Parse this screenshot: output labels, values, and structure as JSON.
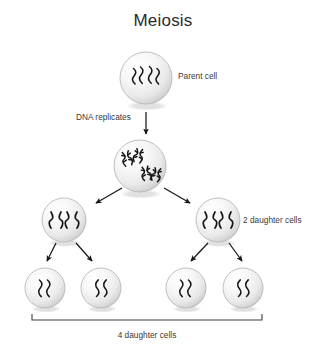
{
  "canvas": {
    "width": 327,
    "height": 349,
    "background": "#ffffff"
  },
  "title": "Meiosis",
  "labels": {
    "parent_cell": "Parent cell",
    "dna_replicates": "DNA replicates",
    "two_daughter_cells": "2 daughter cells",
    "four_daughter_cells": "4 daughter cells"
  },
  "colors": {
    "text": "#3a3a3a",
    "title": "#2b2b2b",
    "chromosome": "#161616",
    "arrow": "#161616",
    "cell_edge": "#b9b9b9",
    "cell_fill_light": "#fdfdfd",
    "cell_fill_dark": "#d2d2d2",
    "bracket": "#3c3c3c"
  },
  "cells": [
    {
      "id": "parent-cell",
      "stage": "parent",
      "cx": 146,
      "cy": 78,
      "r": 26,
      "chromatin_type": "wavy-strands",
      "chromatin_count": 4
    },
    {
      "id": "replicated-cell",
      "stage": "after-replication",
      "cx": 140,
      "cy": 166,
      "r": 26,
      "chromatin_type": "replicated-pairs",
      "chromatin_count": 2
    },
    {
      "id": "daughter-cell-left",
      "stage": "meiosis-i-product",
      "cx": 64,
      "cy": 220,
      "r": 22,
      "chromatin_type": "x-chromosomes",
      "chromatin_count": 2
    },
    {
      "id": "daughter-cell-right",
      "stage": "meiosis-i-product",
      "cx": 218,
      "cy": 220,
      "r": 22,
      "chromatin_type": "x-chromosomes",
      "chromatin_count": 2
    },
    {
      "id": "granddaughter-cell-1",
      "stage": "meiosis-ii-product",
      "cx": 45,
      "cy": 288,
      "r": 20,
      "chromatin_type": "wavy-strands",
      "chromatin_count": 2
    },
    {
      "id": "granddaughter-cell-2",
      "stage": "meiosis-ii-product",
      "cx": 101,
      "cy": 288,
      "r": 20,
      "chromatin_type": "wavy-strands",
      "chromatin_count": 2
    },
    {
      "id": "granddaughter-cell-3",
      "stage": "meiosis-ii-product",
      "cx": 186,
      "cy": 288,
      "r": 20,
      "chromatin_type": "wavy-strands",
      "chromatin_count": 2
    },
    {
      "id": "granddaughter-cell-4",
      "stage": "meiosis-ii-product",
      "cx": 243,
      "cy": 288,
      "r": 20,
      "chromatin_type": "wavy-strands",
      "chromatin_count": 2
    }
  ],
  "arrows": [
    {
      "id": "arrow-replication",
      "x1": 146,
      "y1": 112,
      "x2": 146,
      "y2": 136,
      "direction": "down"
    },
    {
      "id": "arrow-to-left-daughter",
      "x1": 121,
      "y1": 189,
      "x2": 93,
      "y2": 205,
      "direction": "down-left"
    },
    {
      "id": "arrow-to-right-daughter",
      "x1": 166,
      "y1": 189,
      "x2": 194,
      "y2": 205,
      "direction": "down-right"
    },
    {
      "id": "arrow-left-to-gd1",
      "x1": 55,
      "y1": 244,
      "x2": 45,
      "y2": 263,
      "direction": "down-left"
    },
    {
      "id": "arrow-left-to-gd2",
      "x1": 78,
      "y1": 244,
      "x2": 93,
      "y2": 263,
      "direction": "down-right"
    },
    {
      "id": "arrow-right-to-gd3",
      "x1": 207,
      "y1": 244,
      "x2": 194,
      "y2": 263,
      "direction": "down-left"
    },
    {
      "id": "arrow-right-to-gd4",
      "x1": 230,
      "y1": 244,
      "x2": 243,
      "y2": 263,
      "direction": "down-right"
    }
  ],
  "bracket": {
    "x_start": 32,
    "x_end": 262,
    "y": 320,
    "tick_height": 6
  },
  "text_positions": {
    "title": {
      "x": 163,
      "y": 26,
      "anchor": "middle"
    },
    "parent_cell": {
      "x": 178,
      "y": 79,
      "anchor": "start"
    },
    "dna_replicates": {
      "x": 76,
      "y": 120,
      "anchor": "start"
    },
    "two_daughter_cells": {
      "x": 243,
      "y": 223,
      "anchor": "start"
    },
    "four_daughter_cells": {
      "x": 147,
      "y": 338,
      "anchor": "middle"
    }
  }
}
